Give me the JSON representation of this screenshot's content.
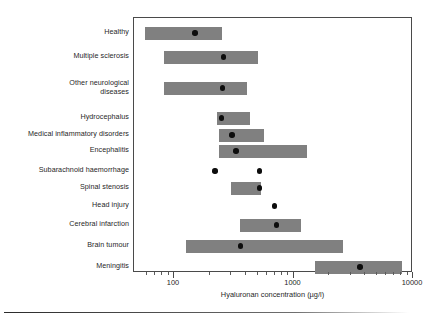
{
  "figure": {
    "background_color": "#ffffff",
    "frame_color": "#4a4a4a",
    "bar_color": "#808080",
    "dot_color": "#0d0d0d",
    "bottom_rule": "horizontal-rule"
  },
  "chart_data": {
    "type": "bar",
    "orientation": "horizontal",
    "subtype": "range-bars-with-median",
    "title": "",
    "xlabel": "Hyaluronan concentration (µg/l)",
    "ylabel": "",
    "xscale": "log",
    "xlim": [
      50,
      10000
    ],
    "grid": false,
    "legend": null,
    "xticks": [
      100,
      1000,
      10000
    ],
    "xticklabels": [
      "100",
      "1000",
      "10000"
    ],
    "categories": [
      "Healthy",
      "Multiple sclerosis",
      "Other neurological\ndiseases",
      "Hydrocephalus",
      "Medical inflammatory disorders",
      "Encephalitis",
      "Subarachnoid haemorrhage",
      "Spinal stenosis",
      "Head injury",
      "Cerebral infarction",
      "Brain tumour",
      "Meningitis"
    ],
    "series": [
      {
        "name": "Range (min–max)",
        "kind": "range",
        "values": [
          [
            57,
            250
          ],
          [
            83,
            500
          ],
          [
            83,
            410
          ],
          [
            230,
            430
          ],
          [
            240,
            570
          ],
          [
            240,
            1300
          ],
          [
            null,
            null
          ],
          [
            300,
            530
          ],
          [
            null,
            null
          ],
          [
            355,
            1150
          ],
          [
            125,
            2600
          ],
          [
            1500,
            8100
          ]
        ]
      },
      {
        "name": "Median",
        "kind": "point",
        "values": [
          150,
          260,
          255,
          250,
          305,
          330,
          220,
          520,
          690,
          720,
          360,
          3600
        ]
      },
      {
        "name": "Additional point",
        "kind": "point",
        "values": [
          null,
          null,
          null,
          null,
          null,
          null,
          520,
          null,
          null,
          null,
          null,
          null
        ]
      }
    ]
  },
  "axis": {
    "minor_ticks": [
      60,
      70,
      80,
      90,
      200,
      300,
      400,
      500,
      600,
      700,
      800,
      900,
      2000,
      3000,
      4000,
      5000,
      6000,
      7000,
      8000,
      9000
    ]
  }
}
